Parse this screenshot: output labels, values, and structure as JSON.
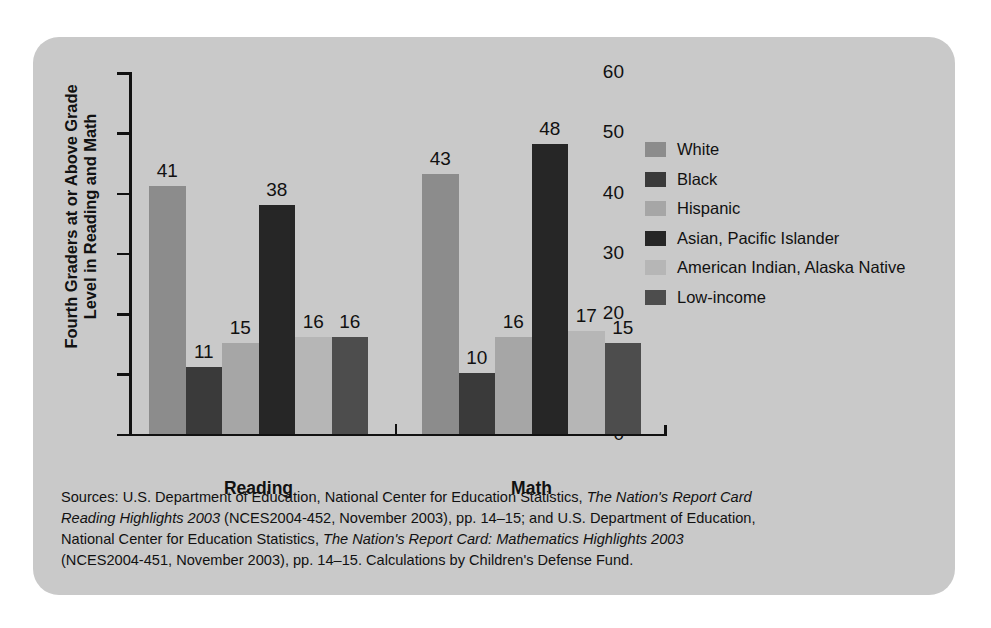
{
  "chart_data": {
    "type": "bar",
    "title": "",
    "xlabel": "",
    "ylabel": "Fourth Graders at or Above Grade Level in Reading and Math",
    "ylabel_line1": "Fourth Graders at or Above Grade",
    "ylabel_line2": "Level in Reading and Math",
    "ylim": [
      0,
      60
    ],
    "yticks": [
      0,
      10,
      20,
      30,
      40,
      50,
      60
    ],
    "grid": false,
    "legend_position": "right",
    "categories": [
      "Reading",
      "Math"
    ],
    "series": [
      {
        "name": "White",
        "color": "#8c8c8c",
        "values": [
          41,
          43
        ]
      },
      {
        "name": "Black",
        "color": "#3a3a3a",
        "values": [
          11,
          10
        ]
      },
      {
        "name": "Hispanic",
        "color": "#a6a6a6",
        "values": [
          15,
          16
        ]
      },
      {
        "name": "Asian, Pacific Islander",
        "color": "#262626",
        "values": [
          38,
          48
        ]
      },
      {
        "name": "American Indian, Alaska Native",
        "color": "#b6b6b6",
        "values": [
          16,
          17
        ]
      },
      {
        "name": "Low-income",
        "color": "#4d4d4d",
        "values": [
          16,
          15
        ]
      }
    ]
  },
  "legend": {
    "items": [
      {
        "label": "White",
        "color": "#8c8c8c"
      },
      {
        "label": "Black",
        "color": "#3a3a3a"
      },
      {
        "label": "Hispanic",
        "color": "#a6a6a6"
      },
      {
        "label": "Asian, Pacific Islander",
        "color": "#262626"
      },
      {
        "label": "American Indian, Alaska Native",
        "color": "#b6b6b6"
      },
      {
        "label": "Low-income",
        "color": "#4d4d4d"
      }
    ]
  },
  "source_note": {
    "line1_a": "Sources: U.S. Department of Education, National Center for Education Statistics, ",
    "line1_b": "The Nation's Report Card",
    "line2_a": "Reading Highlights 2003",
    "line2_b": " (NCES2004-452, November 2003), pp. 14–15; and U.S. Department of Education,",
    "line3_a": "National Center for Education Statistics, ",
    "line3_b": "The Nation's Report Card: Mathematics Highlights 2003",
    "line4": "(NCES2004-451, November 2003), pp. 14–15. Calculations by Children's Defense Fund."
  },
  "colors": {
    "card_background": "#c9c9c9",
    "page_background": "#ffffff",
    "axis": "#111111",
    "text": "#111111"
  }
}
